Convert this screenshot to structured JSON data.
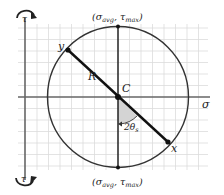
{
  "diagram": {
    "type": "mohrs-circle",
    "axes": {
      "horizontal_label": "σ",
      "vertical_label_top": "τ",
      "vertical_label_bottom": "τ"
    },
    "points": {
      "center_label": "C",
      "x_label": "x",
      "y_label": "y",
      "radius_label": "R",
      "angle_label": "2θ",
      "angle_subscript": "s"
    },
    "annotations": {
      "top": {
        "open": "(σ",
        "sub1": "avg",
        "sep": ", τ",
        "sub2": "max",
        "close": ")"
      },
      "bottom": {
        "open": "(σ",
        "sub1": "avg",
        "sep": ", τ",
        "sub2": "max",
        "close": ")"
      }
    },
    "colors": {
      "grid": "#d9d9d9",
      "axis": "#666666",
      "circle": "#333333",
      "diameter": "#111111",
      "angle_fill": "#d4d4d4"
    }
  }
}
